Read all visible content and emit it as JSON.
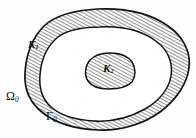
{
  "figure": {
    "caption_present": false,
    "type": "mathematical-domain-diagram",
    "background_color": "#fdfdfd",
    "ink_color": "#101010",
    "hatch_color": "#1a1a1a"
  },
  "labels": {
    "outer_domain": {
      "symbol": "Ω",
      "subscript": "0",
      "name": "omega-zero"
    },
    "outer_boundary": {
      "symbol": "Γ",
      "subscript": "0",
      "name": "gamma-zero"
    },
    "annulus_region": {
      "symbol": "K",
      "subscript": "1",
      "name": "k-one"
    },
    "inner_region": {
      "symbol": "K",
      "subscript": "2",
      "name": "k-two"
    }
  },
  "regions": [
    {
      "id": "outer-annulus",
      "label": "K1",
      "fill": "hatched",
      "description": "ring between outer closed curve and middle closed curve"
    },
    {
      "id": "middle-ring",
      "label": "",
      "fill": "white",
      "description": "unhatched ring between middle curve and inner blob"
    },
    {
      "id": "inner-blob",
      "label": "K2",
      "fill": "hatched",
      "description": "small hatched closed region at center"
    }
  ],
  "hatching": {
    "angle_degrees": 62,
    "spacing_px": 2.6,
    "stroke_width_px": 0.9
  },
  "curves": {
    "outer": {
      "stroke_width_px": 1.6,
      "closed": true
    },
    "middle": {
      "stroke_width_px": 1.5,
      "closed": true
    },
    "inner": {
      "stroke_width_px": 1.5,
      "closed": true
    }
  }
}
